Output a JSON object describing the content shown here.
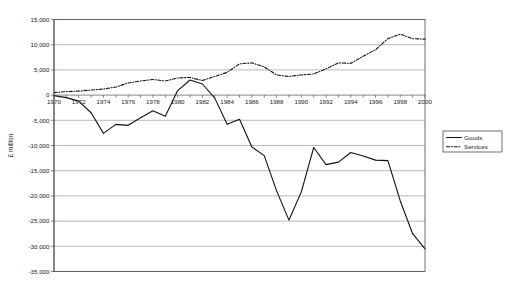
{
  "chart_data": {
    "type": "line",
    "title": "",
    "xlabel": "",
    "ylabel": "£ million",
    "ylim": [
      -35000,
      15000
    ],
    "ytick_step": 5000,
    "grid": true,
    "legend_position": "right",
    "x": [
      1970,
      1971,
      1972,
      1973,
      1974,
      1975,
      1976,
      1977,
      1978,
      1979,
      1980,
      1981,
      1982,
      1983,
      1984,
      1985,
      1986,
      1987,
      1988,
      1989,
      1990,
      1991,
      1992,
      1993,
      1994,
      1995,
      1996,
      1997,
      1998,
      1999,
      2000
    ],
    "x_tick_labels": [
      "1970",
      "1972",
      "1974",
      "1976",
      "1978",
      "1980",
      "1982",
      "1984",
      "1986",
      "1988",
      "1990",
      "1992",
      "1994",
      "1996",
      "1998",
      "2000"
    ],
    "y_tick_labels": [
      "15,000",
      "10,000",
      "5,000",
      "0",
      "-5,000",
      "-10,000",
      "-15,000",
      "-20,000",
      "-25,000",
      "-30,000",
      "-35,000"
    ],
    "y_tick_values": [
      15000,
      10000,
      5000,
      0,
      -5000,
      -10000,
      -15000,
      -20000,
      -25000,
      -30000,
      -35000
    ],
    "series": [
      {
        "name": "Goods",
        "style": "solid",
        "color": "#111111",
        "values": [
          -100,
          -500,
          -1200,
          -3500,
          -7600,
          -5800,
          -6000,
          -4500,
          -3100,
          -4200,
          900,
          3000,
          2200,
          -600,
          -5800,
          -4800,
          -10300,
          -12000,
          -19000,
          -24800,
          -19200,
          -10400,
          -13800,
          -13300,
          -11400,
          -12100,
          -12900,
          -13000,
          -21000,
          -27500,
          -30500
        ]
      },
      {
        "name": "Services",
        "style": "dashed",
        "color": "#111111",
        "values": [
          500,
          700,
          800,
          1000,
          1200,
          1600,
          2400,
          2800,
          3100,
          2800,
          3400,
          3500,
          2900,
          3700,
          4500,
          6200,
          6400,
          5600,
          4000,
          3700,
          4000,
          4200,
          5200,
          6400,
          6300,
          7700,
          9000,
          11200,
          12100,
          11200,
          11100
        ]
      }
    ]
  },
  "legend": {
    "items": [
      {
        "label": "Goods",
        "style": "solid"
      },
      {
        "label": "Services",
        "style": "dashed"
      }
    ]
  }
}
